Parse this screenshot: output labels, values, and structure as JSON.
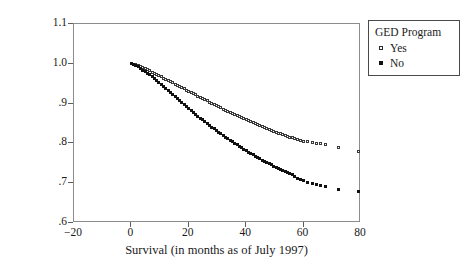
{
  "chart_data": {
    "type": "scatter",
    "title": "",
    "xlabel": "Survival (in months as of July 1997)",
    "ylabel": "Cumulative Percentage Survival",
    "xlim": [
      -20,
      80
    ],
    "ylim": [
      0.6,
      1.1
    ],
    "xticks": [
      -20,
      0,
      20,
      40,
      60,
      80
    ],
    "xtick_labels": [
      "−20",
      "0",
      "20",
      "40",
      "60",
      "80"
    ],
    "yticks": [
      0.6,
      0.7,
      0.8,
      0.9,
      1.0,
      1.1
    ],
    "ytick_labels": [
      ".6",
      ".7",
      ".8",
      ".9",
      "1.0",
      "1.1"
    ],
    "grid": false,
    "legend": {
      "title": "GED Program",
      "position": "outside-top-right",
      "entries": [
        {
          "label": "Yes",
          "marker": "open-square",
          "color": "#3a3a3a"
        },
        {
          "label": "No",
          "marker": "filled-square",
          "color": "#111111"
        }
      ]
    },
    "series": [
      {
        "name": "Yes",
        "marker": "open-square",
        "color": "#3a3a3a",
        "points": [
          [
            0.0,
            1.0
          ],
          [
            0.8,
            0.999
          ],
          [
            1.6,
            0.997
          ],
          [
            2.4,
            0.995
          ],
          [
            3.2,
            0.993
          ],
          [
            4.0,
            0.99
          ],
          [
            4.8,
            0.988
          ],
          [
            5.6,
            0.985
          ],
          [
            6.4,
            0.982
          ],
          [
            7.2,
            0.979
          ],
          [
            8.0,
            0.976
          ],
          [
            8.8,
            0.973
          ],
          [
            9.6,
            0.97
          ],
          [
            10.4,
            0.967
          ],
          [
            11.2,
            0.964
          ],
          [
            12.0,
            0.961
          ],
          [
            12.8,
            0.958
          ],
          [
            13.6,
            0.955
          ],
          [
            14.4,
            0.952
          ],
          [
            15.2,
            0.949
          ],
          [
            16.0,
            0.946
          ],
          [
            16.8,
            0.943
          ],
          [
            17.6,
            0.94
          ],
          [
            18.4,
            0.937
          ],
          [
            19.2,
            0.934
          ],
          [
            20.0,
            0.931
          ],
          [
            20.8,
            0.928
          ],
          [
            21.6,
            0.925
          ],
          [
            22.4,
            0.922
          ],
          [
            23.2,
            0.919
          ],
          [
            24.0,
            0.916
          ],
          [
            24.8,
            0.913
          ],
          [
            25.6,
            0.91
          ],
          [
            26.4,
            0.907
          ],
          [
            27.2,
            0.904
          ],
          [
            28.0,
            0.901
          ],
          [
            28.8,
            0.898
          ],
          [
            29.6,
            0.895
          ],
          [
            30.4,
            0.892
          ],
          [
            31.2,
            0.889
          ],
          [
            32.0,
            0.886
          ],
          [
            32.8,
            0.883
          ],
          [
            33.6,
            0.88
          ],
          [
            34.4,
            0.878
          ],
          [
            35.2,
            0.875
          ],
          [
            36.0,
            0.872
          ],
          [
            36.8,
            0.87
          ],
          [
            37.6,
            0.867
          ],
          [
            38.4,
            0.865
          ],
          [
            39.2,
            0.862
          ],
          [
            40.0,
            0.86
          ],
          [
            40.8,
            0.857
          ],
          [
            41.6,
            0.855
          ],
          [
            42.4,
            0.852
          ],
          [
            43.2,
            0.85
          ],
          [
            44.0,
            0.847
          ],
          [
            44.8,
            0.845
          ],
          [
            45.6,
            0.842
          ],
          [
            46.4,
            0.84
          ],
          [
            47.2,
            0.838
          ],
          [
            48.0,
            0.835
          ],
          [
            48.8,
            0.833
          ],
          [
            49.6,
            0.831
          ],
          [
            50.4,
            0.828
          ],
          [
            51.2,
            0.826
          ],
          [
            52.0,
            0.824
          ],
          [
            52.8,
            0.822
          ],
          [
            53.6,
            0.82
          ],
          [
            54.4,
            0.818
          ],
          [
            55.2,
            0.816
          ],
          [
            56.0,
            0.814
          ],
          [
            57.0,
            0.812
          ],
          [
            58.0,
            0.81
          ],
          [
            59.0,
            0.808
          ],
          [
            60.0,
            0.806
          ],
          [
            61.5,
            0.804
          ],
          [
            63.0,
            0.802
          ],
          [
            64.5,
            0.8
          ],
          [
            66.0,
            0.799
          ],
          [
            67.5,
            0.798
          ],
          [
            72.0,
            0.79
          ],
          [
            79.0,
            0.78
          ]
        ]
      },
      {
        "name": "No",
        "marker": "filled-square",
        "color": "#111111",
        "points": [
          [
            0.0,
            1.0
          ],
          [
            0.8,
            0.998
          ],
          [
            1.6,
            0.995
          ],
          [
            2.4,
            0.992
          ],
          [
            3.2,
            0.988
          ],
          [
            4.0,
            0.984
          ],
          [
            4.8,
            0.98
          ],
          [
            5.6,
            0.976
          ],
          [
            6.4,
            0.972
          ],
          [
            7.2,
            0.967
          ],
          [
            8.0,
            0.962
          ],
          [
            8.8,
            0.957
          ],
          [
            9.6,
            0.952
          ],
          [
            10.4,
            0.947
          ],
          [
            11.2,
            0.942
          ],
          [
            12.0,
            0.937
          ],
          [
            12.8,
            0.932
          ],
          [
            13.6,
            0.927
          ],
          [
            14.4,
            0.922
          ],
          [
            15.2,
            0.917
          ],
          [
            16.0,
            0.912
          ],
          [
            16.8,
            0.907
          ],
          [
            17.6,
            0.902
          ],
          [
            18.4,
            0.897
          ],
          [
            19.2,
            0.892
          ],
          [
            20.0,
            0.887
          ],
          [
            20.8,
            0.882
          ],
          [
            21.6,
            0.877
          ],
          [
            22.4,
            0.872
          ],
          [
            23.2,
            0.868
          ],
          [
            24.0,
            0.863
          ],
          [
            24.8,
            0.859
          ],
          [
            25.6,
            0.854
          ],
          [
            26.4,
            0.85
          ],
          [
            27.2,
            0.845
          ],
          [
            28.0,
            0.841
          ],
          [
            28.8,
            0.837
          ],
          [
            29.6,
            0.832
          ],
          [
            30.4,
            0.828
          ],
          [
            31.2,
            0.824
          ],
          [
            32.0,
            0.82
          ],
          [
            32.8,
            0.816
          ],
          [
            33.6,
            0.812
          ],
          [
            34.4,
            0.808
          ],
          [
            35.2,
            0.804
          ],
          [
            36.0,
            0.8
          ],
          [
            36.8,
            0.796
          ],
          [
            37.6,
            0.793
          ],
          [
            38.4,
            0.789
          ],
          [
            39.2,
            0.785
          ],
          [
            40.0,
            0.782
          ],
          [
            40.8,
            0.778
          ],
          [
            41.6,
            0.775
          ],
          [
            42.4,
            0.771
          ],
          [
            43.2,
            0.768
          ],
          [
            44.0,
            0.765
          ],
          [
            44.8,
            0.761
          ],
          [
            45.6,
            0.758
          ],
          [
            46.4,
            0.755
          ],
          [
            47.2,
            0.752
          ],
          [
            48.0,
            0.749
          ],
          [
            48.8,
            0.746
          ],
          [
            49.6,
            0.743
          ],
          [
            50.4,
            0.74
          ],
          [
            51.2,
            0.737
          ],
          [
            52.0,
            0.734
          ],
          [
            52.8,
            0.731
          ],
          [
            53.6,
            0.729
          ],
          [
            54.4,
            0.726
          ],
          [
            55.2,
            0.724
          ],
          [
            56.0,
            0.722
          ],
          [
            57.0,
            0.716
          ],
          [
            58.0,
            0.712
          ],
          [
            59.0,
            0.709
          ],
          [
            60.0,
            0.706
          ],
          [
            61.5,
            0.702
          ],
          [
            63.0,
            0.699
          ],
          [
            64.5,
            0.696
          ],
          [
            66.0,
            0.694
          ],
          [
            67.5,
            0.692
          ],
          [
            72.0,
            0.685
          ],
          [
            79.0,
            0.68
          ]
        ]
      }
    ]
  }
}
